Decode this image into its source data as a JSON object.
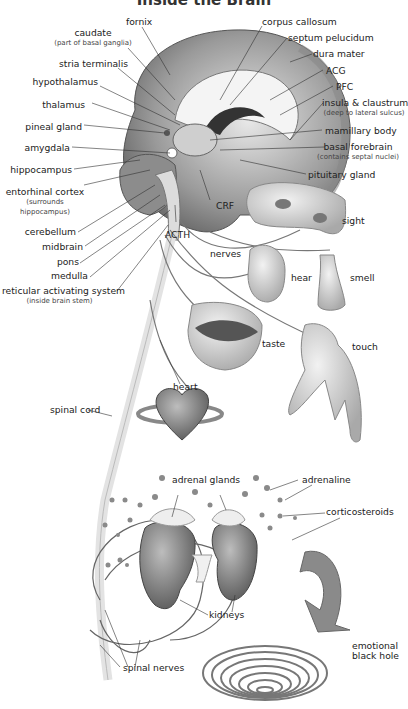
{
  "title": "Inside the Brain",
  "labels": {
    "fornix": "fornix",
    "caudate": "caudate",
    "caudate_sub": "(part of basal ganglia)",
    "stria_terminalis": "stria terminalis",
    "hypothalamus": "hypothalamus",
    "thalamus": "thalamus",
    "pineal_gland": "pineal gland",
    "amygdala": "amygdala",
    "hippocampus": "hippocampus",
    "entorhinal_cortex": "entorhinal cortex",
    "entorhinal_sub1": "(surrounds",
    "entorhinal_sub2": "hippocampus)",
    "cerebellum": "cerebellum",
    "midbrain": "midbrain",
    "pons": "pons",
    "medulla": "medulla",
    "ras": "reticular activating system",
    "ras_sub": "(inside brain stem)",
    "corpus_callosum": "corpus callosum",
    "septum_pelucidum": "septum pelucidum",
    "dura_mater": "dura mater",
    "acg": "ACG",
    "pfc": "PFC",
    "insula": "insula & claustrum",
    "insula_sub": "(deep to lateral sulcus)",
    "mamillary_body": "mamillary body",
    "basal_forebrain": "basal forebrain",
    "basal_forebrain_sub": "(contains septal nuclei)",
    "pituitary_gland": "pituitary gland",
    "crf": "CRF",
    "acth": "ACTH",
    "nerves": "nerves",
    "sight": "sight",
    "hear": "hear",
    "smell": "smell",
    "taste": "taste",
    "touch": "touch",
    "heart": "heart",
    "spinal_cord": "spinal cord",
    "adrenal_glands": "adrenal glands",
    "adrenaline": "adrenaline",
    "corticosteroids": "corticosteroids",
    "kidneys": "kidneys",
    "spinal_nerves": "spinal nerves",
    "emotional": "emotional",
    "black_hole": "black hole"
  }
}
